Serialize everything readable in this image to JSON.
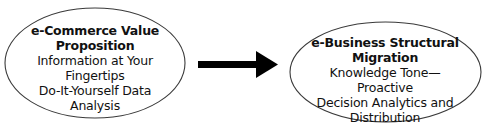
{
  "diagram": {
    "type": "flow",
    "nodes": [
      {
        "id": "left",
        "shape": "ellipse",
        "title_lines": [
          "e-Commerce Value",
          "Proposition"
        ],
        "body_lines": [
          "Information at Your",
          "Fingertips",
          "Do-It-Yourself Data",
          "Analysis"
        ]
      },
      {
        "id": "right",
        "shape": "ellipse",
        "title_lines": [
          "e-Business Structural",
          "Migration"
        ],
        "body_lines": [
          "Knowledge Tone—Proactive",
          "Decision Analytics and",
          "Distribution"
        ]
      }
    ],
    "edges": [
      {
        "from": "left",
        "to": "right",
        "style": "thick-arrow"
      }
    ],
    "colors": {
      "stroke": "#3a3a3a",
      "arrow": "#000000",
      "background": "#ffffff"
    }
  }
}
